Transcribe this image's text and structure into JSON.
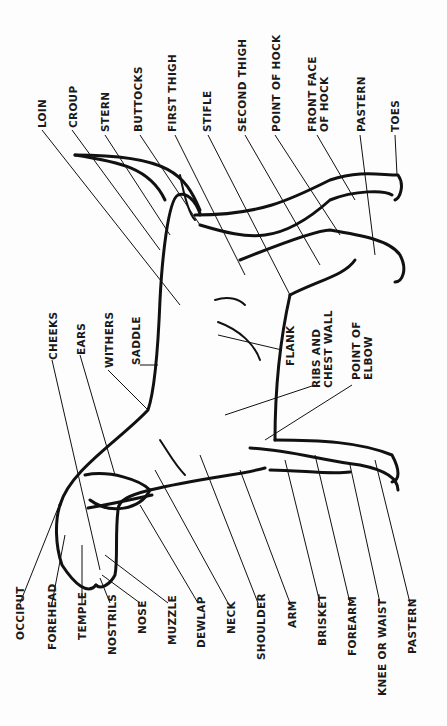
{
  "diagram": {
    "orientation": "rotated 90° counter-clockwise",
    "labels_bottom": [
      "OCCIPUT",
      "FOREHEAD",
      "TEMPLE",
      "NOSTRILS",
      "NOSE",
      "MUZZLE",
      "DEWLAP",
      "NECK",
      "SHOULDER",
      "ARM",
      "BRISKET",
      "FOREARM",
      "KNEE OR WAIST",
      "PASTERN"
    ],
    "labels_top": [
      "LOIN",
      "CROUP",
      "STERN",
      "BUTTOCKS",
      "FIRST THIGH",
      "STIFLE",
      "SECOND THIGH",
      "POINT OF HOCK",
      "FRONT FACE\nOF HOCK",
      "PASTERN",
      "TOES"
    ],
    "labels_middle": [
      "CHEEKS",
      "EARS",
      "WITHERS",
      "SADDLE",
      "FLANK",
      "RIBS AND\nCHEST WALL",
      "POINT OF\nELBOW"
    ],
    "line_color": "#111111"
  }
}
